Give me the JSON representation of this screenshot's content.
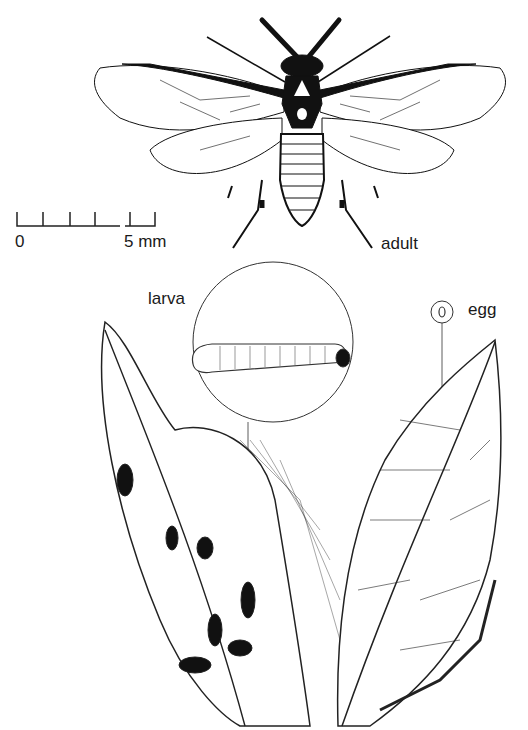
{
  "figure": {
    "labels": {
      "adult": "adult",
      "larva": "larva",
      "egg": "egg"
    },
    "scale_bar": {
      "start_label": "0",
      "end_label": "5 mm",
      "ticks": 6
    }
  }
}
